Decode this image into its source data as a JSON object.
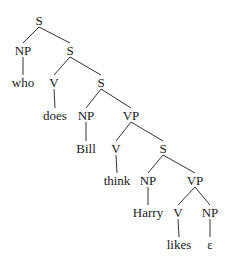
{
  "diagram": {
    "type": "syntax-tree",
    "nodes": [
      {
        "id": "s1",
        "label": "S",
        "x": 39,
        "y": 20
      },
      {
        "id": "np1",
        "label": "NP",
        "x": 23,
        "y": 50
      },
      {
        "id": "s2",
        "label": "S",
        "x": 70,
        "y": 50
      },
      {
        "id": "who",
        "label": "who",
        "x": 23,
        "y": 82
      },
      {
        "id": "v1",
        "label": "V",
        "x": 54,
        "y": 82
      },
      {
        "id": "s3",
        "label": "S",
        "x": 101,
        "y": 82
      },
      {
        "id": "does",
        "label": "does",
        "x": 55,
        "y": 115
      },
      {
        "id": "np2",
        "label": "NP",
        "x": 86,
        "y": 115
      },
      {
        "id": "vp1",
        "label": "VP",
        "x": 131,
        "y": 115
      },
      {
        "id": "bill",
        "label": "Bill",
        "x": 86,
        "y": 148
      },
      {
        "id": "v2",
        "label": "V",
        "x": 116,
        "y": 148
      },
      {
        "id": "s4",
        "label": "S",
        "x": 163,
        "y": 148
      },
      {
        "id": "think",
        "label": "think",
        "x": 117,
        "y": 180
      },
      {
        "id": "np3",
        "label": "NP",
        "x": 148,
        "y": 180
      },
      {
        "id": "vp2",
        "label": "VP",
        "x": 195,
        "y": 180
      },
      {
        "id": "harry",
        "label": "Harry",
        "x": 148,
        "y": 212
      },
      {
        "id": "v3",
        "label": "V",
        "x": 178,
        "y": 212
      },
      {
        "id": "np4",
        "label": "NP",
        "x": 210,
        "y": 212
      },
      {
        "id": "likes",
        "label": "likes",
        "x": 179,
        "y": 244
      },
      {
        "id": "eps",
        "label": "ε",
        "x": 210,
        "y": 244
      }
    ],
    "edges": [
      [
        "s1",
        "np1"
      ],
      [
        "s1",
        "s2"
      ],
      [
        "np1",
        "who"
      ],
      [
        "s2",
        "v1"
      ],
      [
        "s2",
        "s3"
      ],
      [
        "v1",
        "does"
      ],
      [
        "s3",
        "np2"
      ],
      [
        "s3",
        "vp1"
      ],
      [
        "np2",
        "bill"
      ],
      [
        "vp1",
        "v2"
      ],
      [
        "vp1",
        "s4"
      ],
      [
        "v2",
        "think"
      ],
      [
        "s4",
        "np3"
      ],
      [
        "s4",
        "vp2"
      ],
      [
        "np3",
        "harry"
      ],
      [
        "vp2",
        "v3"
      ],
      [
        "vp2",
        "np4"
      ],
      [
        "v3",
        "likes"
      ],
      [
        "np4",
        "eps"
      ]
    ],
    "line_color": "#333333",
    "text_color": "#1a1a1a"
  }
}
